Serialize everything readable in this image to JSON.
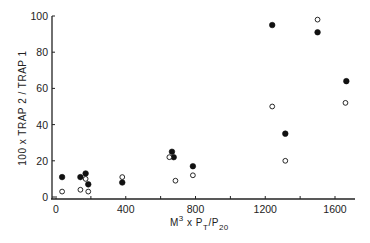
{
  "chart_data": {
    "type": "scatter",
    "title": "",
    "xlabel": "M³ x P_T / P_20",
    "ylabel": "100 x TRAP 2 / TRAP 1",
    "xlim": [
      0,
      1700
    ],
    "ylim": [
      0,
      100
    ],
    "x_ticks": [
      0,
      400,
      800,
      1200,
      1600
    ],
    "x_minor_ticks": [
      200,
      600,
      1000,
      1400
    ],
    "y_ticks": [
      0,
      20,
      40,
      60,
      80,
      100
    ],
    "grid": false,
    "legend": null,
    "series": [
      {
        "name": "filled",
        "marker": "filled-circle",
        "color": "#111111",
        "points": [
          [
            35,
            11
          ],
          [
            140,
            11
          ],
          [
            170,
            13
          ],
          [
            185,
            7
          ],
          [
            380,
            8
          ],
          [
            665,
            25
          ],
          [
            675,
            22
          ],
          [
            785,
            17
          ],
          [
            1240,
            95
          ],
          [
            1315,
            35
          ],
          [
            1500,
            91
          ],
          [
            1665,
            64
          ]
        ]
      },
      {
        "name": "open",
        "marker": "open-circle",
        "color": "#111111",
        "points": [
          [
            35,
            3
          ],
          [
            140,
            4
          ],
          [
            170,
            10
          ],
          [
            185,
            3
          ],
          [
            380,
            11
          ],
          [
            650,
            22
          ],
          [
            685,
            9
          ],
          [
            785,
            12
          ],
          [
            1240,
            50
          ],
          [
            1315,
            20
          ],
          [
            1500,
            98
          ],
          [
            1660,
            52
          ]
        ]
      }
    ]
  },
  "axes": {
    "y_label": "100 x TRAP 2 / TRAP 1",
    "x_label_main": "M",
    "x_label_sup": "3",
    "x_label_mid": " x P",
    "x_label_sub1": "T",
    "x_label_slash": "/P",
    "x_label_sub2": "20"
  }
}
